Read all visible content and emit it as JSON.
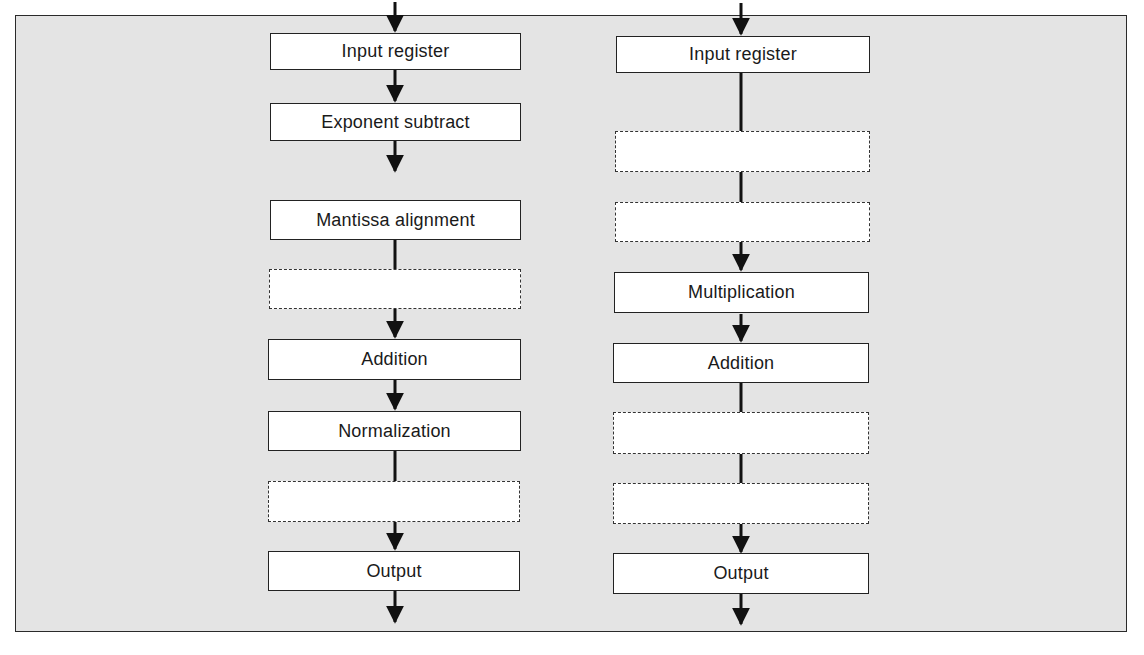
{
  "diagram": {
    "type": "pipeline-comparison",
    "background_color": "#e4e4e4",
    "box_fill": "#ffffff",
    "line_color": "#111111",
    "pipelines": [
      {
        "name": "floating-point-adder",
        "stages": [
          {
            "label": "Input register",
            "style": "solid"
          },
          {
            "label": "Exponent subtract",
            "style": "solid"
          },
          {
            "label": "Mantissa alignment",
            "style": "solid"
          },
          {
            "label": "",
            "style": "dashed"
          },
          {
            "label": "Addition",
            "style": "solid"
          },
          {
            "label": "Normalization",
            "style": "solid"
          },
          {
            "label": "",
            "style": "dashed"
          },
          {
            "label": "Output",
            "style": "solid"
          }
        ]
      },
      {
        "name": "multiply-add-pipeline",
        "stages": [
          {
            "label": "Input register",
            "style": "solid"
          },
          {
            "label": "",
            "style": "dashed"
          },
          {
            "label": "",
            "style": "dashed"
          },
          {
            "label": "Multiplication",
            "style": "solid"
          },
          {
            "label": "Addition",
            "style": "solid"
          },
          {
            "label": "",
            "style": "dashed"
          },
          {
            "label": "",
            "style": "dashed"
          },
          {
            "label": "Output",
            "style": "solid"
          }
        ]
      }
    ]
  }
}
